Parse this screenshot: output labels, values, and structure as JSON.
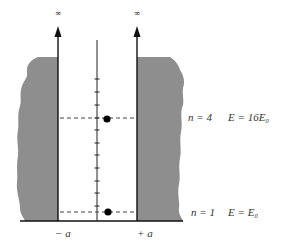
{
  "colors": {
    "wall": "#8e8e8e",
    "line": "#111111",
    "dash": "#444444",
    "background": "#ffffff"
  },
  "symbols": {
    "infinity_left": "∞",
    "infinity_right": "∞"
  },
  "axis_labels": {
    "left": "− a",
    "right": "+ a"
  },
  "levels": [
    {
      "n_label": "n = 4",
      "energy_label": "E = 16E₀",
      "n": 4,
      "energy": "16E0"
    },
    {
      "n_label": "n = 1",
      "energy_label": "E = E₀",
      "n": 1,
      "energy": "E0"
    }
  ],
  "ticks_count": 11
}
